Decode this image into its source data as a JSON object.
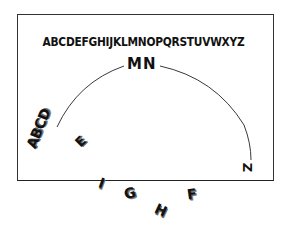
{
  "diagram": {
    "alphabet": "ABCDEFGHIJKLMNOPQRSTUVWXYZ",
    "arc_top_label": "MN",
    "arc_left_label": "ABCD",
    "arc_right_label": "Z",
    "scattered_letters": {
      "e": "E",
      "i": "I",
      "g": "G",
      "h": "H",
      "f": "F"
    },
    "colors": {
      "ink": "#111111",
      "frame": "#333333",
      "background": "#ffffff"
    }
  }
}
